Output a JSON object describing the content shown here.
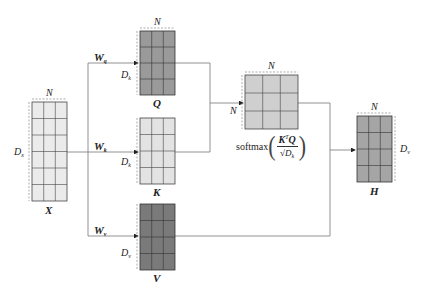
{
  "diagram": {
    "matrices": [
      {
        "id": "X",
        "label": "X",
        "rows": 6,
        "cols": 3,
        "width_label": "N",
        "height_label": "D",
        "height_sub": "x",
        "fill": "#ebebeb"
      },
      {
        "id": "Q",
        "label": "Q",
        "rows": 4,
        "cols": 3,
        "width_label": "N",
        "height_label": "D",
        "height_sub": "k",
        "fill": "#9a9a9a"
      },
      {
        "id": "K",
        "label": "K",
        "rows": 4,
        "cols": 3,
        "width_label": "N",
        "height_label": "D",
        "height_sub": "k",
        "fill": "#e3e3e3"
      },
      {
        "id": "V",
        "label": "V",
        "rows": 4,
        "cols": 3,
        "width_label": "N",
        "height_label": "D",
        "height_sub": "v",
        "fill": "#7a7a7a"
      },
      {
        "id": "A",
        "label": "",
        "rows": 3,
        "cols": 3,
        "width_label": "N",
        "height_label": "N",
        "height_sub": "",
        "fill": "#cfcfcf"
      },
      {
        "id": "H",
        "label": "H",
        "rows": 4,
        "cols": 3,
        "width_label": "N",
        "height_label": "D",
        "height_sub": "v",
        "fill": "#a5a5a5"
      }
    ],
    "weights": [
      {
        "name": "W",
        "sub": "q"
      },
      {
        "name": "W",
        "sub": "k"
      },
      {
        "name": "W",
        "sub": "v"
      }
    ],
    "formula": {
      "func": "softmax",
      "numerator": "K",
      "numerator_sup": "T",
      "numerator_tail": "Q",
      "denominator": "√D",
      "denominator_sub": "k"
    },
    "colors": {
      "line": "#6e6e6e",
      "grid": "#444444",
      "dash": "#888888"
    }
  }
}
